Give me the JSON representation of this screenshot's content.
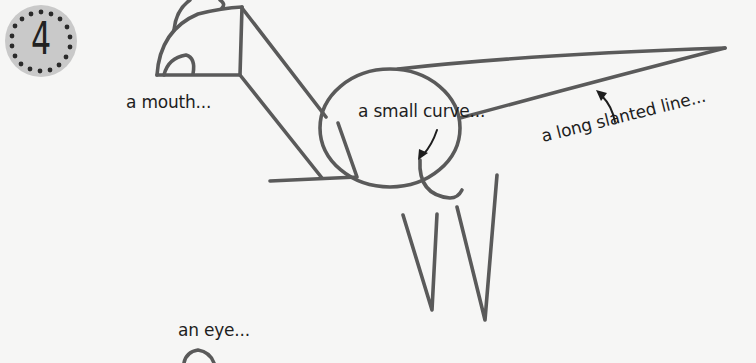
{
  "step": {
    "number": "4",
    "badge_color": "#c9c9c9"
  },
  "labels": {
    "mouth": "a mouth...",
    "small_curve": "a small curve...",
    "long_slanted_line": "a long slanted line...",
    "eye": "an eye..."
  },
  "colors": {
    "background": "#f6f6f5",
    "pencil_stroke": "#5a5a5a",
    "text": "#1e1e1e"
  }
}
